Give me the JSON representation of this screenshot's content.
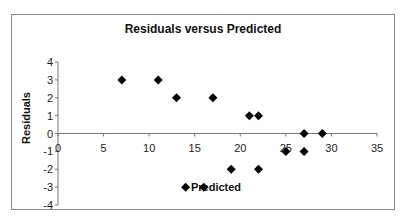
{
  "chart_data": {
    "type": "scatter",
    "title": "Residuals versus Predicted",
    "xlabel": "Predicted",
    "ylabel": "Residuals",
    "xlim": [
      0,
      35
    ],
    "ylim": [
      -4,
      4
    ],
    "xticks": [
      0,
      5,
      10,
      15,
      20,
      25,
      30,
      35
    ],
    "yticks": [
      4,
      3,
      2,
      1,
      0,
      -1,
      -2,
      -3,
      -4
    ],
    "grid": false,
    "legend": null,
    "marker": "diamond",
    "marker_color": "#000000",
    "series": [
      {
        "name": "Residuals",
        "x": [
          7,
          11,
          13,
          17,
          21,
          22,
          27,
          29,
          14,
          16,
          19,
          22,
          25,
          27
        ],
        "y": [
          3,
          3,
          2,
          2,
          1,
          1,
          0,
          0,
          -3,
          -3,
          -2,
          -2,
          -1,
          -1
        ]
      }
    ]
  }
}
